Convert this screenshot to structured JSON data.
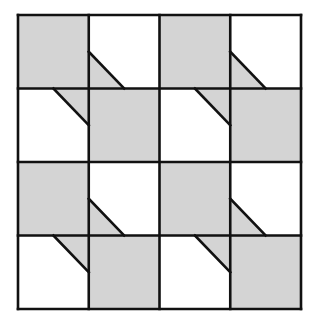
{
  "diagram": {
    "type": "quilt-block-tessellation",
    "rows": 4,
    "cols": 4,
    "grid": {
      "x0": 18,
      "y0": 15,
      "x1": 301,
      "y1": 309
    },
    "colors": {
      "shaded": "#d4d4d4",
      "unshaded": "#ffffff",
      "line": "#111111"
    },
    "line_width": 2.6,
    "cells": [
      [
        "shaded",
        "unshaded",
        "shaded",
        "unshaded"
      ],
      [
        "unshaded",
        "shaded",
        "unshaded",
        "shaded"
      ],
      [
        "shaded",
        "unshaded",
        "shaded",
        "unshaded"
      ],
      [
        "unshaded",
        "shaded",
        "unshaded",
        "shaded"
      ]
    ],
    "triangles": [
      {
        "row": 0,
        "col": 1,
        "corner": "bottom-left",
        "fraction": 0.5
      },
      {
        "row": 0,
        "col": 3,
        "corner": "bottom-left",
        "fraction": 0.5
      },
      {
        "row": 1,
        "col": 0,
        "corner": "top-right",
        "fraction": 0.5
      },
      {
        "row": 1,
        "col": 2,
        "corner": "top-right",
        "fraction": 0.5
      },
      {
        "row": 2,
        "col": 1,
        "corner": "bottom-left",
        "fraction": 0.5
      },
      {
        "row": 2,
        "col": 3,
        "corner": "bottom-left",
        "fraction": 0.5
      },
      {
        "row": 3,
        "col": 0,
        "corner": "top-right",
        "fraction": 0.5
      },
      {
        "row": 3,
        "col": 2,
        "corner": "top-right",
        "fraction": 0.5
      }
    ]
  }
}
